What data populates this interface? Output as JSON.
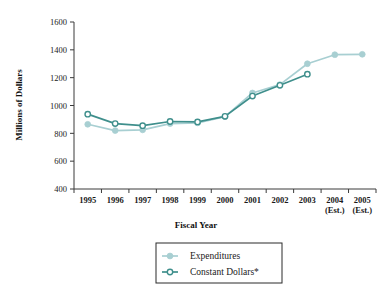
{
  "chart_data": {
    "type": "line",
    "title": "",
    "xlabel": "Fiscal Year",
    "ylabel": "Millions of Dollars",
    "categories": [
      "1995",
      "1996",
      "1997",
      "1998",
      "1999",
      "2000",
      "2001",
      "2002",
      "2003",
      "2004",
      "2005"
    ],
    "category_sublabels": [
      "",
      "",
      "",
      "",
      "",
      "",
      "",
      "",
      "",
      "(Est.)",
      "(Est.)"
    ],
    "ylim": [
      400,
      1600
    ],
    "yticks": [
      400,
      600,
      800,
      1000,
      1200,
      1400,
      1600
    ],
    "ytick_labels": [
      "400",
      "600",
      "800",
      "1000",
      "1200",
      "1400",
      "1600"
    ],
    "grid": false,
    "legend_position": "below-center",
    "series": [
      {
        "name": "Expenditures",
        "marker": "filled-circle",
        "color": "#a8cfd2",
        "values": [
          865,
          820,
          825,
          870,
          875,
          920,
          1090,
          1150,
          1300,
          1365,
          1368
        ]
      },
      {
        "name": "Constant Dollars*",
        "marker": "open-circle",
        "color": "#3f8f8c",
        "values": [
          938,
          870,
          855,
          885,
          882,
          922,
          1068,
          1145,
          1225,
          null,
          null
        ]
      }
    ]
  },
  "legend": {
    "entries": [
      {
        "label": "Expenditures"
      },
      {
        "label": "Constant Dollars*"
      }
    ]
  },
  "axes": {
    "y_title": "Millions of Dollars",
    "x_title": "Fiscal Year"
  },
  "colors": {
    "expenditures": "#a8cfd2",
    "constant_dollars": "#3f8f8c",
    "axis": "#3a3a3a",
    "text": "#1a1a1a",
    "background": "#ffffff"
  }
}
